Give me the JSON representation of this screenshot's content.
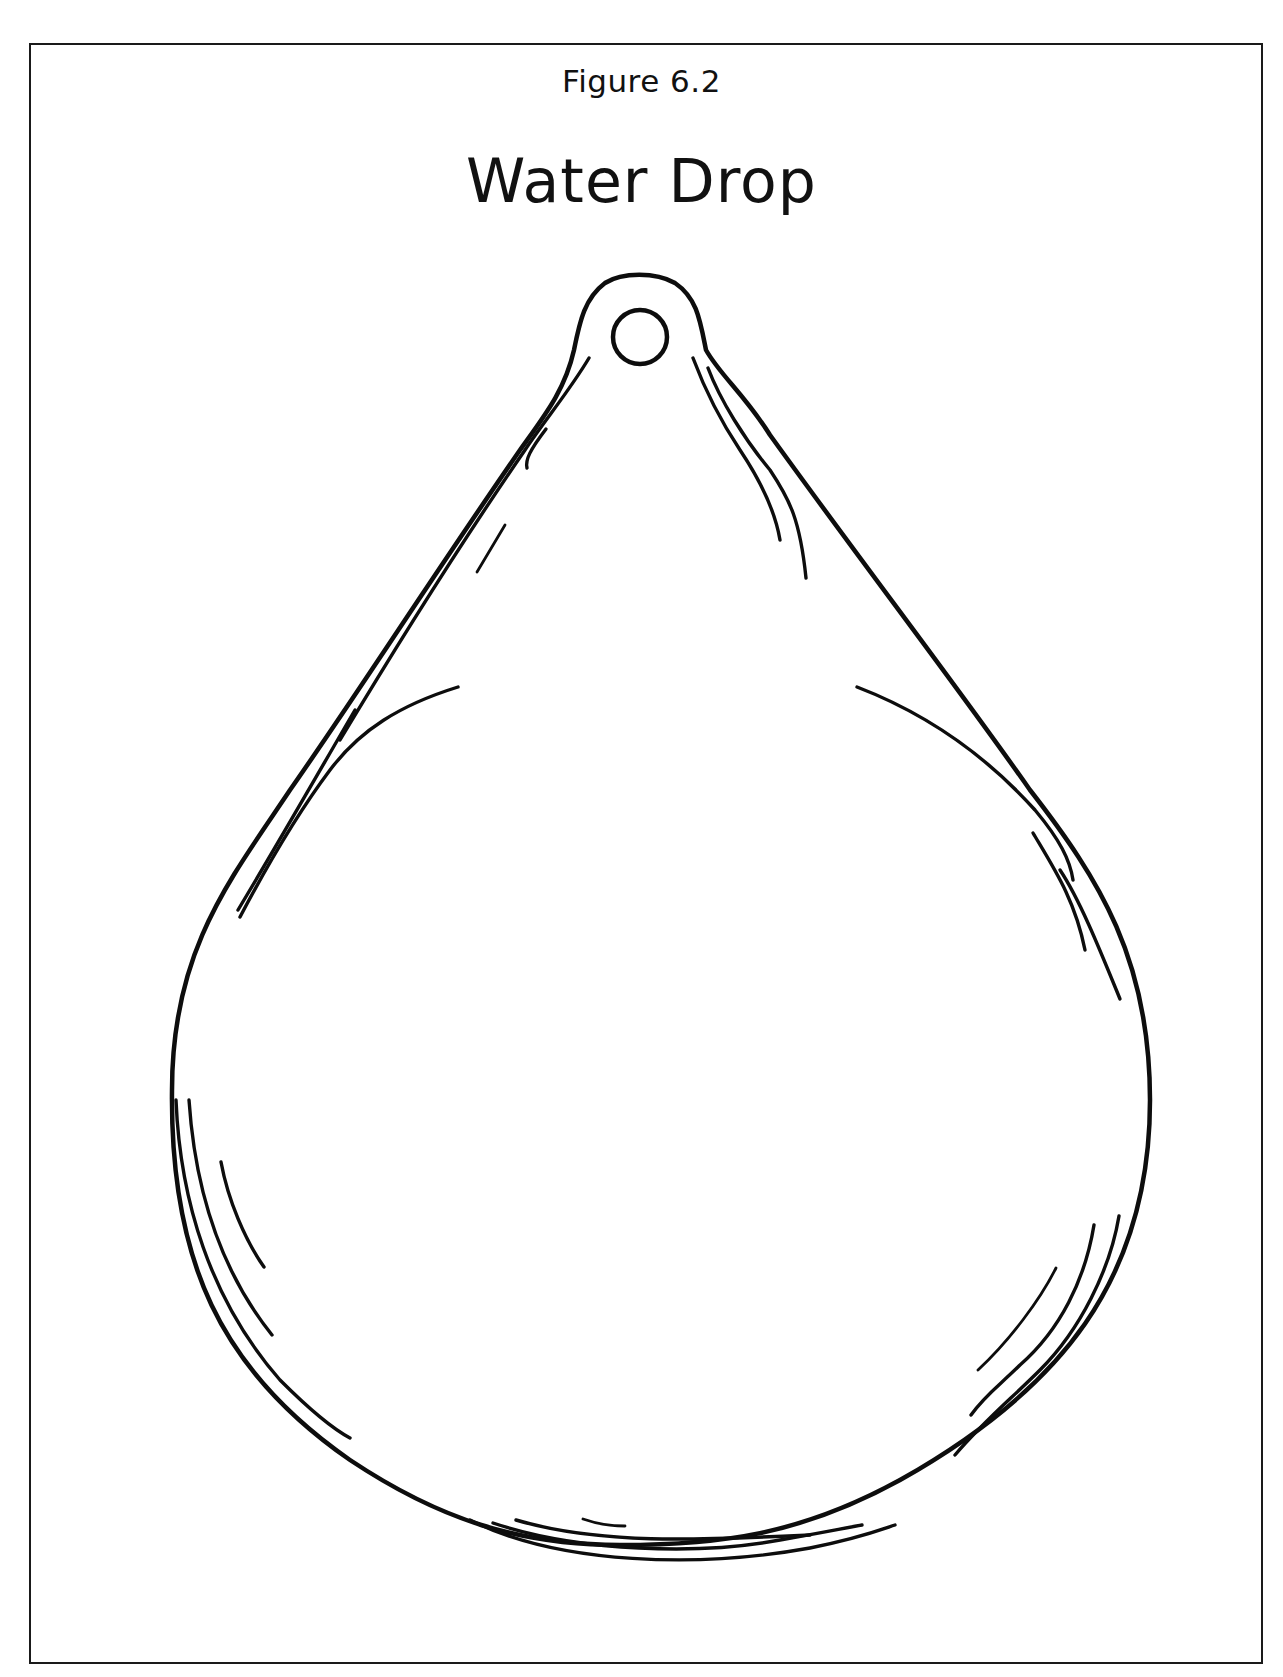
{
  "figure": {
    "label": "Figure 6.2",
    "title": "Water Drop"
  },
  "illustration": {
    "subject": "water-drop-outline",
    "style": "black line art on white",
    "features": [
      "hanging-loop-hole",
      "highlight-strokes"
    ]
  },
  "colors": {
    "ink": "#0d0d0d",
    "background": "#ffffff",
    "frame": "#1a1a1a"
  }
}
